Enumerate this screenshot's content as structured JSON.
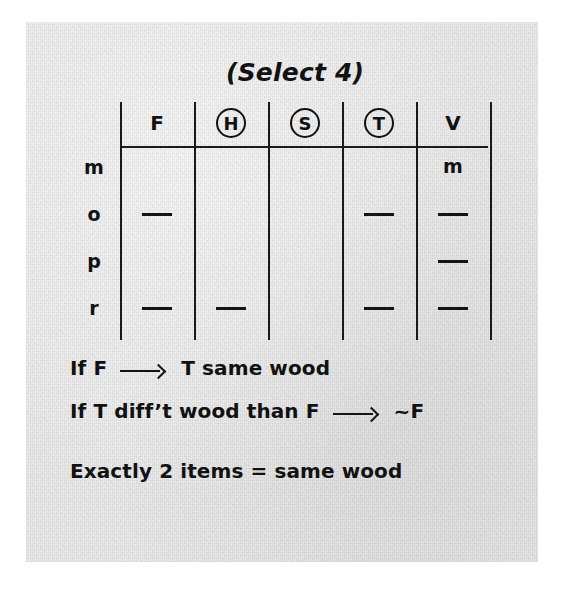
{
  "page": {
    "title": "(Select 4)",
    "paper_color": "#e9e9e9",
    "ink_color": "#141414"
  },
  "grid": {
    "columns": [
      {
        "label": "F",
        "circled": false
      },
      {
        "label": "H",
        "circled": true
      },
      {
        "label": "S",
        "circled": true
      },
      {
        "label": "T",
        "circled": true
      },
      {
        "label": "V",
        "circled": false
      }
    ],
    "rows": [
      {
        "label": "m",
        "cells": [
          "",
          "",
          "",
          "",
          "m"
        ]
      },
      {
        "label": "o",
        "cells": [
          "dash",
          "",
          "",
          "dash",
          "dash"
        ]
      },
      {
        "label": "p",
        "cells": [
          "",
          "",
          "",
          "",
          "dash"
        ]
      },
      {
        "label": "r",
        "cells": [
          "dash",
          "dash",
          "",
          "dash",
          "dash"
        ]
      }
    ]
  },
  "rules": [
    {
      "before": "If F",
      "arrow": "⟶",
      "after": "T same wood"
    },
    {
      "before": "If T diff’t wood than F",
      "arrow": "⟶",
      "after": "~F"
    }
  ],
  "conclusion": "Exactly 2 items = same wood"
}
